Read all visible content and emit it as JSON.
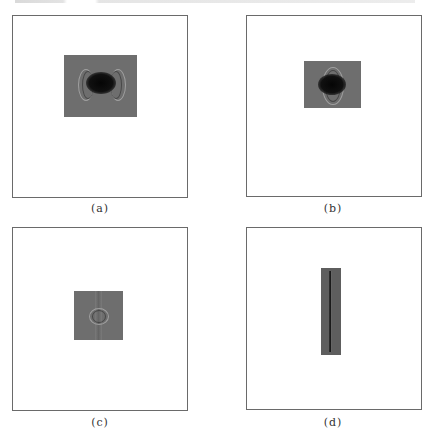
{
  "figure": {
    "panels": [
      {
        "id": "a",
        "label": "(a)",
        "description": "square field with rectangular gray patch, dark elliptical blob with interference fringes left and right"
      },
      {
        "id": "b",
        "label": "(b)",
        "description": "square field with smaller rectangular patch, dark blob with radial fringes above and below"
      },
      {
        "id": "c",
        "label": "(c)",
        "description": "square field with small square patch, faint ring fringes at center"
      },
      {
        "id": "d",
        "label": "(d)",
        "description": "square field with tall narrow vertical strip containing a dark center line"
      }
    ]
  },
  "colors": {
    "frame": "#6a6a6a",
    "patch": "#6e6e6e",
    "blob": "#080808",
    "background": "#ffffff"
  }
}
